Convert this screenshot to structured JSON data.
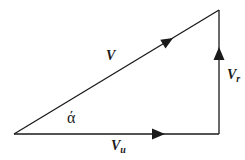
{
  "diagram": {
    "type": "velocity-triangle",
    "vertices": {
      "origin": [
        14,
        134
      ],
      "right_angle": [
        219,
        134
      ],
      "apex": [
        219,
        10
      ]
    },
    "vectors": [
      {
        "name": "V",
        "label": "V",
        "subscript": "",
        "from": "origin",
        "to": "apex"
      },
      {
        "name": "Vu",
        "label": "V",
        "subscript": "u",
        "from": "origin",
        "to": "right_angle"
      },
      {
        "name": "Vr",
        "label": "V",
        "subscript": "r",
        "from": "right_angle",
        "to": "apex"
      }
    ],
    "angle": {
      "symbol": "ά",
      "at": "origin",
      "between": [
        "V",
        "Vu"
      ]
    },
    "colors": {
      "stroke": "#1a1a1a",
      "background": "#ffffff"
    }
  },
  "labels": {
    "v": "V",
    "vu_main": "V",
    "vu_sub": "u",
    "vr_main": "V",
    "vr_sub": "r",
    "alpha": "ά"
  }
}
